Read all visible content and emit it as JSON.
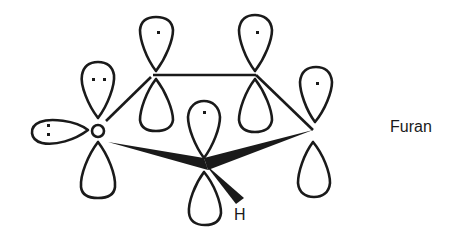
{
  "diagram": {
    "title": "Furan",
    "labels": {
      "molecule": "Furan",
      "hydrogen": "H"
    },
    "atoms": [
      {
        "id": "O",
        "type": "oxygen",
        "p_orbital_electrons": 2,
        "lone_pair_sp2_electrons": 2
      },
      {
        "id": "C2",
        "type": "carbon",
        "p_orbital_electrons": 1
      },
      {
        "id": "C3",
        "type": "carbon",
        "p_orbital_electrons": 1
      },
      {
        "id": "C4",
        "type": "carbon",
        "p_orbital_electrons": 1
      },
      {
        "id": "C5",
        "type": "carbon",
        "p_orbital_electrons": 1
      }
    ],
    "colors": {
      "line": "#1a1a1a",
      "background": "#ffffff"
    }
  }
}
